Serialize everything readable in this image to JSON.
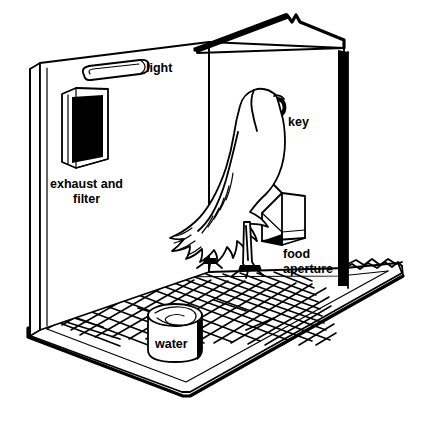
{
  "figure": {
    "background_color": "#ffffff",
    "ink_color": "#000000",
    "style": "black-and-white line drawing"
  },
  "labels": {
    "light": "light",
    "exhaust_line1": "exhaust and",
    "exhaust_line2": "filter",
    "key": "key",
    "food_line1": "food",
    "food_line2": "aperture",
    "water": "water"
  },
  "parts": {
    "light_fixture": "light-fixture",
    "exhaust_vent": "exhaust-and-filter-vent",
    "response_key": "response-key-disc",
    "food_aperture": "food-aperture-opening",
    "water_dish": "water-dish",
    "grid_floor": "wire-grid-floor",
    "pigeon": "pigeon",
    "left_wall": "left-wall",
    "back_wall": "back-wall",
    "right_wall": "right-wall",
    "base_platform": "base-platform"
  }
}
